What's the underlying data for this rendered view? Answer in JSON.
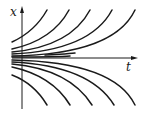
{
  "diagram": {
    "type": "integral-curves",
    "axes": {
      "vertical_label": "x",
      "horizontal_label": "t"
    },
    "colors": {
      "ink": "#1a1a1a",
      "background": "#ffffff"
    },
    "curves_upper_count": 5,
    "curves_lower_count": 5
  }
}
